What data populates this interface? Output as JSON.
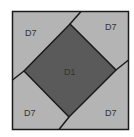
{
  "diagram": {
    "title": "",
    "colors": {
      "background": "#ffffff",
      "outer_fill": "#b4b4b4",
      "center_fill": "#5a5a5a",
      "stroke": "#1a1a1a"
    },
    "regions": [
      {
        "id": "top-left",
        "label": "D7"
      },
      {
        "id": "top-right",
        "label": "D7"
      },
      {
        "id": "bottom-left",
        "label": "D7"
      },
      {
        "id": "bottom-right",
        "label": "D7"
      },
      {
        "id": "center",
        "label": "D1"
      }
    ]
  }
}
